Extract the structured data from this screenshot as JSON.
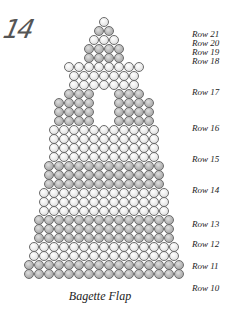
{
  "page_number": "14",
  "caption": "Bagette Flap",
  "bead": {
    "size": 10,
    "row_height": 9,
    "colors": {
      "light": "#f0f0f0",
      "grey": "#b0b0b0"
    }
  },
  "bead_rows": [
    {
      "y": 17,
      "count": 1,
      "color": "light",
      "cx": 100
    },
    {
      "y": 26,
      "count": 2,
      "color": "grey",
      "cx": 100
    },
    {
      "y": 35,
      "count": 3,
      "color": "light",
      "cx": 100
    },
    {
      "y": 44,
      "count": 4,
      "color": "grey",
      "cx": 100
    },
    {
      "y": 53,
      "count": 4,
      "color": "grey",
      "cx": 100
    },
    {
      "y": 62,
      "count": 8,
      "color": "light",
      "cx": 100
    },
    {
      "y": 71,
      "count": 7,
      "color": "light",
      "cx": 100
    },
    {
      "y": 80,
      "count": 7,
      "color": "light",
      "cx": 100
    },
    {
      "y": 89,
      "count": 8,
      "color": "grey",
      "cx": 100,
      "gap": [
        3,
        4
      ]
    },
    {
      "y": 98,
      "count": 10,
      "color": "grey",
      "cx": 100,
      "gap": [
        4,
        5
      ]
    },
    {
      "y": 107,
      "count": 10,
      "color": "grey",
      "cx": 100,
      "gap": [
        4,
        5
      ]
    },
    {
      "y": 116,
      "count": 10,
      "color": "grey",
      "cx": 100,
      "gap": [
        4,
        5
      ]
    },
    {
      "y": 125,
      "count": 11,
      "color": "light",
      "cx": 100
    },
    {
      "y": 134,
      "count": 11,
      "color": "light",
      "cx": 100
    },
    {
      "y": 143,
      "count": 11,
      "color": "light",
      "cx": 100
    },
    {
      "y": 152,
      "count": 11,
      "color": "light",
      "cx": 100
    },
    {
      "y": 161,
      "count": 12,
      "color": "grey",
      "cx": 100
    },
    {
      "y": 170,
      "count": 12,
      "color": "grey",
      "cx": 100
    },
    {
      "y": 179,
      "count": 12,
      "color": "grey",
      "cx": 100
    },
    {
      "y": 188,
      "count": 13,
      "color": "light",
      "cx": 100
    },
    {
      "y": 197,
      "count": 13,
      "color": "light",
      "cx": 100
    },
    {
      "y": 206,
      "count": 13,
      "color": "light",
      "cx": 100
    },
    {
      "y": 215,
      "count": 14,
      "color": "grey",
      "cx": 100
    },
    {
      "y": 224,
      "count": 14,
      "color": "grey",
      "cx": 100
    },
    {
      "y": 233,
      "count": 14,
      "color": "grey",
      "cx": 100
    },
    {
      "y": 242,
      "count": 15,
      "color": "light",
      "cx": 100
    },
    {
      "y": 251,
      "count": 15,
      "color": "light",
      "cx": 100
    },
    {
      "y": 260,
      "count": 16,
      "color": "grey",
      "cx": 100
    },
    {
      "y": 269,
      "count": 16,
      "color": "grey",
      "cx": 100
    }
  ],
  "row_labels": [
    {
      "text": "Row 21",
      "y": 30
    },
    {
      "text": "Row 20",
      "y": 39
    },
    {
      "text": "Row 19",
      "y": 48
    },
    {
      "text": "Row 18",
      "y": 57
    },
    {
      "text": "Row 17",
      "y": 88
    },
    {
      "text": "Row 16",
      "y": 124
    },
    {
      "text": "Row 15",
      "y": 155
    },
    {
      "text": "Row 14",
      "y": 186
    },
    {
      "text": "Row 13",
      "y": 220
    },
    {
      "text": "Row 12",
      "y": 240
    },
    {
      "text": "Row 11",
      "y": 262
    },
    {
      "text": "Row 10",
      "y": 284
    }
  ]
}
